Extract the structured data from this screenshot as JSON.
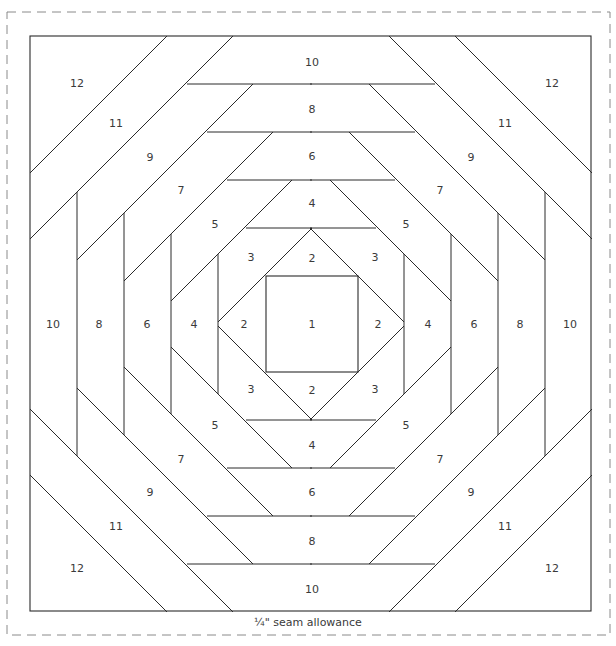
{
  "diagram": {
    "seam_allowance_label": "¼\" seam allowance",
    "colors": {
      "line": "#2a2a2a",
      "dashed_border": "#8a8a8a",
      "label": "#3a3a3a",
      "background": "#ffffff"
    },
    "block": {
      "x": 30,
      "y": 36,
      "width": 561,
      "height": 575
    },
    "seam_border": {
      "x": 7,
      "y": 12,
      "width": 603,
      "height": 623,
      "dash": "9 6"
    },
    "center_square": {
      "x": 266,
      "y": 276,
      "width": 92,
      "height": 96
    },
    "pieces": [
      {
        "label": "1",
        "x": 312,
        "y": 328
      },
      {
        "label": "2",
        "x": 312,
        "y": 262
      },
      {
        "label": "2",
        "x": 244,
        "y": 328
      },
      {
        "label": "2",
        "x": 378,
        "y": 328
      },
      {
        "label": "2",
        "x": 312,
        "y": 394
      },
      {
        "label": "3",
        "x": 251,
        "y": 261
      },
      {
        "label": "3",
        "x": 375,
        "y": 261
      },
      {
        "label": "3",
        "x": 251,
        "y": 393
      },
      {
        "label": "3",
        "x": 375,
        "y": 393
      },
      {
        "label": "4",
        "x": 312,
        "y": 207
      },
      {
        "label": "4",
        "x": 194,
        "y": 328
      },
      {
        "label": "4",
        "x": 428,
        "y": 328
      },
      {
        "label": "4",
        "x": 312,
        "y": 449
      },
      {
        "label": "5",
        "x": 215,
        "y": 228
      },
      {
        "label": "5",
        "x": 406,
        "y": 228
      },
      {
        "label": "5",
        "x": 215,
        "y": 429
      },
      {
        "label": "5",
        "x": 406,
        "y": 429
      },
      {
        "label": "6",
        "x": 312,
        "y": 160
      },
      {
        "label": "6",
        "x": 147,
        "y": 328
      },
      {
        "label": "6",
        "x": 474,
        "y": 328
      },
      {
        "label": "6",
        "x": 312,
        "y": 496
      },
      {
        "label": "7",
        "x": 181,
        "y": 194
      },
      {
        "label": "7",
        "x": 440,
        "y": 194
      },
      {
        "label": "7",
        "x": 181,
        "y": 463
      },
      {
        "label": "7",
        "x": 440,
        "y": 463
      },
      {
        "label": "8",
        "x": 312,
        "y": 113
      },
      {
        "label": "8",
        "x": 99,
        "y": 328
      },
      {
        "label": "8",
        "x": 520,
        "y": 328
      },
      {
        "label": "8",
        "x": 312,
        "y": 545
      },
      {
        "label": "9",
        "x": 150,
        "y": 161
      },
      {
        "label": "9",
        "x": 471,
        "y": 161
      },
      {
        "label": "9",
        "x": 150,
        "y": 496
      },
      {
        "label": "9",
        "x": 471,
        "y": 496
      },
      {
        "label": "10",
        "x": 312,
        "y": 66
      },
      {
        "label": "10",
        "x": 53,
        "y": 328
      },
      {
        "label": "10",
        "x": 570,
        "y": 328
      },
      {
        "label": "10",
        "x": 312,
        "y": 593
      },
      {
        "label": "11",
        "x": 116,
        "y": 127
      },
      {
        "label": "11",
        "x": 505,
        "y": 127
      },
      {
        "label": "11",
        "x": 116,
        "y": 530
      },
      {
        "label": "11",
        "x": 505,
        "y": 530
      },
      {
        "label": "12",
        "x": 77,
        "y": 87
      },
      {
        "label": "12",
        "x": 552,
        "y": 87
      },
      {
        "label": "12",
        "x": 77,
        "y": 572
      },
      {
        "label": "12",
        "x": 552,
        "y": 572
      }
    ],
    "quadrant_lines_top_left": [
      {
        "x1": 312,
        "y1": 228,
        "x2": 218,
        "y2": 322
      },
      {
        "x1": 292,
        "y1": 180,
        "x2": 171,
        "y2": 301
      },
      {
        "x1": 273,
        "y1": 132,
        "x2": 124,
        "y2": 281
      },
      {
        "x1": 253,
        "y1": 84,
        "x2": 77,
        "y2": 260
      },
      {
        "x1": 233,
        "y1": 36,
        "x2": 30,
        "y2": 239
      },
      {
        "x1": 167,
        "y1": 36,
        "x2": 30,
        "y2": 173
      },
      {
        "x1": 246,
        "y1": 228,
        "x2": 312,
        "y2": 228
      },
      {
        "x1": 227,
        "y1": 180,
        "x2": 312,
        "y2": 180
      },
      {
        "x1": 207,
        "y1": 132,
        "x2": 312,
        "y2": 132
      },
      {
        "x1": 187,
        "y1": 84,
        "x2": 312,
        "y2": 84
      },
      {
        "x1": 218,
        "y1": 254,
        "x2": 218,
        "y2": 324
      },
      {
        "x1": 171,
        "y1": 234,
        "x2": 171,
        "y2": 324
      },
      {
        "x1": 124,
        "y1": 213,
        "x2": 124,
        "y2": 324
      },
      {
        "x1": 77,
        "y1": 192,
        "x2": 77,
        "y2": 324
      }
    ],
    "center": {
      "x": 311,
      "y": 324
    }
  }
}
